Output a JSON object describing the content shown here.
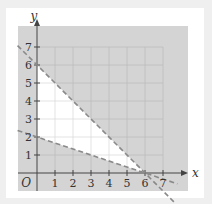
{
  "chart_data": {
    "type": "line",
    "title": "",
    "xlabel": "x",
    "ylabel": "y",
    "origin_label": "O",
    "x_ticks": [
      "1",
      "2",
      "3",
      "4",
      "5",
      "6",
      "7"
    ],
    "y_ticks": [
      "1",
      "2",
      "3",
      "4",
      "5",
      "6",
      "7"
    ],
    "xlim": [
      -1,
      8
    ],
    "ylim": [
      -1,
      8
    ],
    "grid": true,
    "series": [
      {
        "name": "boundary-1",
        "equation": "y = 6 - x",
        "points": [
          [
            0,
            6
          ],
          [
            6,
            0
          ]
        ],
        "style": "dashed"
      },
      {
        "name": "boundary-2",
        "equation": "y = 2 - x/3",
        "points": [
          [
            0,
            2
          ],
          [
            6,
            0
          ]
        ],
        "style": "dashed"
      }
    ],
    "unshaded_region": {
      "vertices": [
        [
          0,
          2
        ],
        [
          0,
          6
        ],
        [
          6,
          0
        ]
      ],
      "description": "feasible region (white triangle)"
    },
    "shaded_region": "everything outside the triangle (gray)"
  },
  "colors": {
    "page_bg": "#efefef",
    "card_bg": "#ffffff",
    "shade": "#d4d4d4",
    "grid": "#bdbdbd",
    "line": "#8a8a8a",
    "axis": "#444444"
  }
}
